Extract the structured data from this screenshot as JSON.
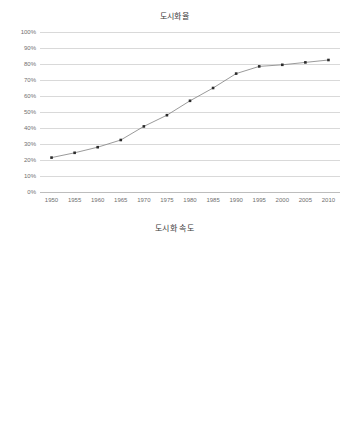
{
  "chart_data": [
    {
      "id": "urbanization-rate",
      "type": "line",
      "title": "도시화율",
      "xlabel": "",
      "ylabel": "",
      "grid": true,
      "legend": "none",
      "ylim": [
        0,
        1.0
      ],
      "ytick_labels": [
        "100%",
        "90%",
        "80%",
        "70%",
        "60%",
        "50%",
        "40%",
        "30%",
        "20%",
        "10%",
        "0%"
      ],
      "ytick_values": [
        1.0,
        0.9,
        0.8,
        0.7,
        0.6,
        0.5,
        0.4,
        0.3,
        0.2,
        0.1,
        0.0
      ],
      "categories": [
        "1950",
        "1955",
        "1960",
        "1965",
        "1970",
        "1975",
        "1980",
        "1985",
        "1990",
        "1995",
        "2000",
        "2005",
        "2010"
      ],
      "values": [
        0.215,
        0.245,
        0.28,
        0.325,
        0.41,
        0.48,
        0.57,
        0.65,
        0.74,
        0.785,
        0.795,
        0.81,
        0.825
      ],
      "value_labels": [
        "21.5%",
        "24.5%",
        "28.0%",
        "32.5%",
        "41.0%",
        "48.0%",
        "57.0%",
        "65.0%",
        "74.0%",
        "78.5%",
        "79.5%",
        "81.0%",
        "82.5%"
      ]
    },
    {
      "id": "urbanization-speed",
      "type": "line",
      "title": "도시화 속도",
      "xlabel": "",
      "ylabel": "",
      "grid": true,
      "legend": "none",
      "ylim": [
        0,
        0.1
      ],
      "ytick_labels": [
        "10.00%",
        "9.00%",
        "8.00%",
        "7.00%",
        "6.00%",
        "5.00%",
        "4.00%",
        "3.00%",
        "2.00%",
        "1.00%",
        "0.00%"
      ],
      "ytick_values": [
        0.1,
        0.09,
        0.08,
        0.07,
        0.06,
        0.05,
        0.04,
        0.03,
        0.02,
        0.01,
        0.0
      ],
      "categories": [
        "1950~1955",
        "1955~1960",
        "1960~1965",
        "1965~1970",
        "1970~1975",
        "1975~1980",
        "1980~1985",
        "1985~1990",
        "1990~1995",
        "1995~2000",
        "2000~2005",
        "2005~2010"
      ],
      "category_from": [
        "1950",
        "1955",
        "1960",
        "1965",
        "1970",
        "1975",
        "1980",
        "1985",
        "1990",
        "1995",
        "2000",
        "2005"
      ],
      "category_to": [
        "1955",
        "1960",
        "1965",
        "1970",
        "1975",
        "1980",
        "1985",
        "1990",
        "1995",
        "2000",
        "2005",
        "2010"
      ],
      "category_separator": "~",
      "values": [
        0.0305,
        0.0335,
        0.0468,
        0.084,
        0.074,
        0.0875,
        0.082,
        0.0902,
        0.0437,
        0.0138,
        0.0168,
        0.0157
      ],
      "value_labels": [
        "3.05%",
        "3.35%",
        "4.68%",
        "8.40%",
        "7.40%",
        "8.75%",
        "8.20%",
        "9.02%",
        "4.37%",
        "1.38%",
        "1.68%",
        "1.57%"
      ]
    }
  ],
  "colors": {
    "line": "#808080",
    "marker": "#2b2b2b",
    "grid": "#d9d9d9",
    "axis": "#bdbdbd",
    "tick_text": "#6f6f6f",
    "title_text": "#3a3a3a",
    "background": "#ffffff"
  }
}
